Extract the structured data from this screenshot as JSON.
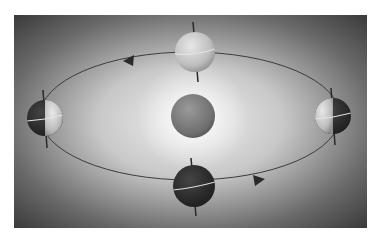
{
  "diagram": {
    "title": "",
    "colors": {
      "page_background": "#ffffff",
      "panel_dark": "#3a3a3a",
      "panel_light": "#e6e6e6",
      "orbit_line": "#3c3c3c",
      "sun_fill": "#7a7a7a",
      "earth_light": "#cfcfcf",
      "earth_dark": "#2e2e2e",
      "axis": "#2a2a2a",
      "equator": "#e8e8e8",
      "arrow": "#2a2a2a"
    },
    "panel": {
      "x": 14,
      "y": 15,
      "width": 353,
      "height": 213
    },
    "orbit": {
      "cx": 190,
      "cy": 116,
      "rx": 150,
      "ry": 64,
      "direction": "counterclockwise"
    },
    "sun": {
      "label": "Sun",
      "cx": 193,
      "cy": 116,
      "r": 22
    },
    "earths": [
      {
        "id": "top",
        "label": "Earth (top of orbit)",
        "cx": 195,
        "cy": 52,
        "r": 20,
        "lit": "full"
      },
      {
        "id": "right",
        "label": "Earth (right of orbit)",
        "cx": 333,
        "cy": 116,
        "r": 18,
        "lit": "left-half"
      },
      {
        "id": "bottom",
        "label": "Earth (bottom of orbit)",
        "cx": 194,
        "cy": 186,
        "r": 21,
        "lit": "none"
      },
      {
        "id": "left",
        "label": "Earth (left of orbit)",
        "cx": 45,
        "cy": 118,
        "r": 18,
        "lit": "right-half"
      }
    ],
    "arrows": [
      {
        "id": "arrow-top",
        "x": 130,
        "y": 60,
        "points": "left"
      },
      {
        "id": "arrow-bottom",
        "x": 258,
        "y": 180,
        "points": "right"
      }
    ]
  }
}
